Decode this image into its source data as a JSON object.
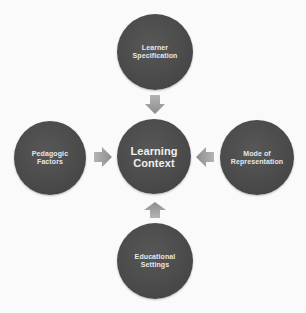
{
  "diagram": {
    "center": {
      "lines": [
        "Learning",
        "Context"
      ]
    },
    "nodes": {
      "top": {
        "lines": [
          "Learner",
          "Specification"
        ]
      },
      "left": {
        "lines": [
          "Pedagogic",
          "Factors"
        ]
      },
      "right": {
        "lines": [
          "Mode of",
          "Representation"
        ]
      },
      "bottom": {
        "lines": [
          "Educational",
          "Settings"
        ]
      }
    },
    "arrows": {
      "top": "arrow-down-icon",
      "left": "arrow-right-icon",
      "right": "arrow-left-icon",
      "bottom": "arrow-up-icon"
    },
    "colors": {
      "circle": "#4b4b4b",
      "arrow": "#9a9a9a",
      "text": "#e8e8e8",
      "background": "#fafafa"
    }
  }
}
